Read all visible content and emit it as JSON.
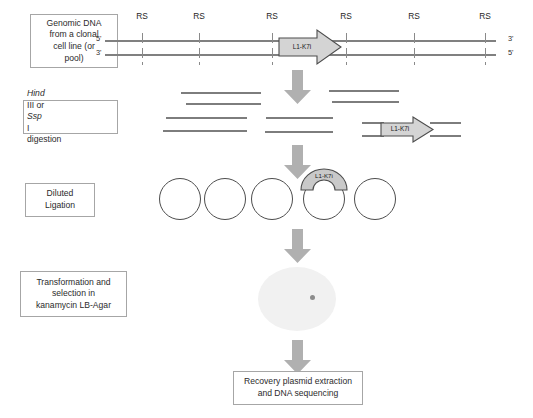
{
  "diagram": {
    "colors": {
      "line_gray": "#808080",
      "arrow_gray": "#b0b0b0",
      "box_border": "#a6a6a6",
      "circle_stroke": "#4d4d4d",
      "dish_fill": "#f1f1f1",
      "colony_fill": "#8c8c8c",
      "text": "#2b2b2b"
    },
    "steps": [
      {
        "id": "step-genomic-dna",
        "box_lines": [
          "Genomic DNA",
          "from a clonal",
          "cell line (or",
          "pool)"
        ]
      },
      {
        "id": "step-digestion",
        "box_lines": [
          "HindIII or SspI",
          "digestion"
        ],
        "enzyme_1_italic": "Hind",
        "enzyme_1_rest": "III or ",
        "enzyme_2_italic": "Ssp",
        "enzyme_2_rest": "I",
        "line2": "digestion"
      },
      {
        "id": "step-ligation",
        "box_lines": [
          "Diluted",
          "Ligation"
        ]
      },
      {
        "id": "step-transformation",
        "box_lines": [
          "Transformation and",
          "selection in",
          "kanamycin LB-Agar"
        ]
      },
      {
        "id": "step-recovery",
        "box_lines": [
          "Recovery plasmid extraction",
          "and DNA sequencing"
        ]
      }
    ],
    "dna": {
      "top_left_end": "5'",
      "top_right_end": "3'",
      "bottom_left_end": "3'",
      "bottom_right_end": "5'",
      "restriction_site_label": "RS",
      "restriction_sites": [
        {
          "label": "RS",
          "x": 142
        },
        {
          "label": "RS",
          "x": 199
        },
        {
          "label": "RS",
          "x": 272
        },
        {
          "label": "RS",
          "x": 346
        },
        {
          "label": "RS",
          "x": 414
        },
        {
          "label": "RS",
          "x": 485
        }
      ],
      "insert_label": "L1-K7i"
    },
    "fragments": [
      {
        "x": 181,
        "y": 92,
        "w": 80
      },
      {
        "x": 186,
        "y": 103,
        "w": 75
      },
      {
        "x": 329,
        "y": 90,
        "w": 70
      },
      {
        "x": 332,
        "y": 101,
        "w": 67
      },
      {
        "x": 166,
        "y": 117,
        "w": 81
      },
      {
        "x": 163,
        "y": 130,
        "w": 84
      },
      {
        "x": 266,
        "y": 117,
        "w": 67
      },
      {
        "x": 265,
        "y": 131,
        "w": 68
      }
    ],
    "fragment_with_insert": {
      "label": "L1-K7i",
      "line_left_x": 362,
      "line_right_end": 461,
      "y_top": 122,
      "y_bottom": 135
    },
    "plasmids": {
      "count": 5,
      "insert_index": 4,
      "insert_label": "L1-K7i",
      "centers_x": [
        180,
        225,
        272,
        324,
        375
      ],
      "center_y": 199,
      "radius": 21
    },
    "plate": {
      "colony_count": 1
    },
    "flow_arrows": [
      {
        "id": "arrow-digest",
        "y": 68
      },
      {
        "id": "arrow-ligate",
        "y": 143
      },
      {
        "id": "arrow-transform",
        "y": 227
      },
      {
        "id": "arrow-recover",
        "y": 340
      }
    ]
  }
}
